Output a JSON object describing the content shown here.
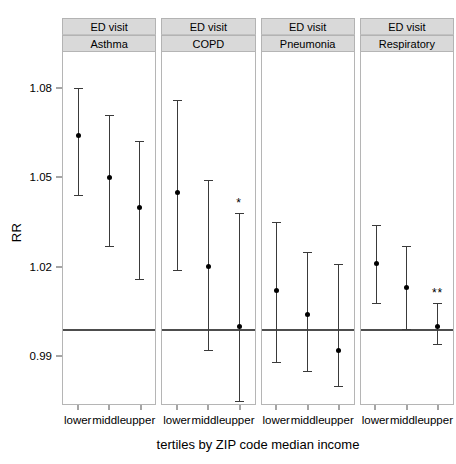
{
  "chart_data": {
    "type": "scatter",
    "title": "",
    "xlabel": "tertiles by ZIP code median income",
    "ylabel": "RR",
    "ylim": [
      0.975,
      1.093
    ],
    "yticks": [
      1.08,
      1.05,
      1.02,
      0.99
    ],
    "ytick_labels": [
      "1.08",
      "1.05",
      "1.02",
      "0.99"
    ],
    "reference_line": 1.0,
    "grid": false,
    "legend": "none",
    "categories": [
      "lower",
      "middle",
      "upper"
    ],
    "facet_strip_top": "ED visit",
    "panels": [
      {
        "strip_top": "ED visit",
        "strip_bottom": "Asthma",
        "points": [
          {
            "category": "lower",
            "rr": 1.065,
            "lower_ci": 1.045,
            "upper_ci": 1.081,
            "significance": ""
          },
          {
            "category": "middle",
            "rr": 1.051,
            "lower_ci": 1.028,
            "upper_ci": 1.072,
            "significance": ""
          },
          {
            "category": "upper",
            "rr": 1.041,
            "lower_ci": 1.017,
            "upper_ci": 1.063,
            "significance": ""
          }
        ]
      },
      {
        "strip_top": "ED visit",
        "strip_bottom": "COPD",
        "points": [
          {
            "category": "lower",
            "rr": 1.046,
            "lower_ci": 1.02,
            "upper_ci": 1.077,
            "significance": ""
          },
          {
            "category": "middle",
            "rr": 1.021,
            "lower_ci": 0.993,
            "upper_ci": 1.05,
            "significance": ""
          },
          {
            "category": "upper",
            "rr": 1.001,
            "lower_ci": 0.976,
            "upper_ci": 1.039,
            "significance": "*"
          }
        ]
      },
      {
        "strip_top": "ED visit",
        "strip_bottom": "Pneumonia",
        "points": [
          {
            "category": "lower",
            "rr": 1.013,
            "lower_ci": 0.989,
            "upper_ci": 1.036,
            "significance": ""
          },
          {
            "category": "middle",
            "rr": 1.005,
            "lower_ci": 0.986,
            "upper_ci": 1.026,
            "significance": ""
          },
          {
            "category": "upper",
            "rr": 0.993,
            "lower_ci": 0.981,
            "upper_ci": 1.022,
            "significance": ""
          }
        ]
      },
      {
        "strip_top": "ED visit",
        "strip_bottom": "Respiratory",
        "points": [
          {
            "category": "lower",
            "rr": 1.022,
            "lower_ci": 1.009,
            "upper_ci": 1.035,
            "significance": ""
          },
          {
            "category": "middle",
            "rr": 1.014,
            "lower_ci": 1.0,
            "upper_ci": 1.028,
            "significance": ""
          },
          {
            "category": "upper",
            "rr": 1.001,
            "lower_ci": 0.995,
            "upper_ci": 1.009,
            "significance": "**"
          }
        ]
      }
    ],
    "colors": {
      "point": "#000000",
      "whisker": "#3a3a3a",
      "reference_line": "#4d4d4d",
      "strip_background": "#d9d9d9",
      "panel_border": "#b5b5b5",
      "background": "#ffffff"
    }
  }
}
